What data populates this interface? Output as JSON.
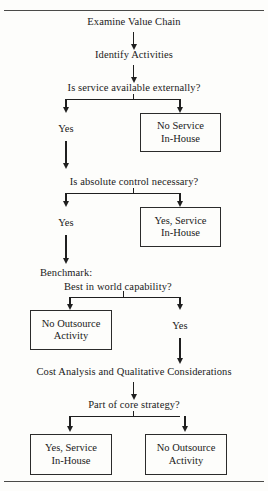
{
  "diagram": {
    "title_rules": {
      "top": "horizontal-rule",
      "bottom": "horizontal-rule"
    },
    "steps": {
      "examine": "Examine Value Chain",
      "identify": "Identify Activities",
      "decision_external": "Is service available externally?",
      "decision_control": "Is absolute control necessary?",
      "benchmark_label": "Benchmark:",
      "benchmark_question": "Best in world capability?",
      "cost_analysis": "Cost Analysis and Qualitative Considerations",
      "decision_core": "Part of core strategy?"
    },
    "labels": {
      "yes_external": "Yes",
      "yes_control": "Yes",
      "yes_benchmark": "Yes"
    },
    "boxes": {
      "no_service_inhouse": {
        "line1": "No Service",
        "line2": "In-House"
      },
      "yes_service_inhouse": {
        "line1": "Yes, Service",
        "line2": "In-House"
      },
      "no_outsource_activity": {
        "line1": "No Outsource",
        "line2": "Activity"
      },
      "final_yes_service": {
        "line1": "Yes, Service",
        "line2": "In-House"
      },
      "final_no_outsource": {
        "line1": "No Outsource",
        "line2": "Activity"
      }
    },
    "colors": {
      "ink": "#1f1f1f",
      "rule": "#4a4a48",
      "paper": "#fdfdfb"
    }
  }
}
